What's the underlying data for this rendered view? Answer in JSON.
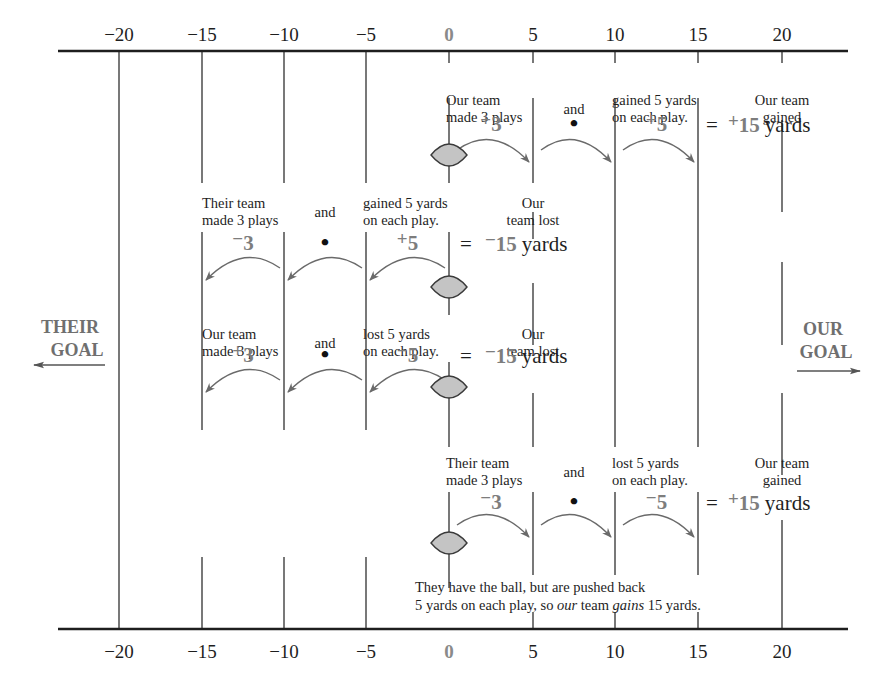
{
  "axis": {
    "ticks": [
      {
        "value": -20,
        "label": "−20",
        "x": 119
      },
      {
        "value": -15,
        "label": "−15",
        "x": 202
      },
      {
        "value": -10,
        "label": "−10",
        "x": 284
      },
      {
        "value": -5,
        "label": "−5",
        "x": 366
      },
      {
        "value": 0,
        "label": "0",
        "x": 449
      },
      {
        "value": 5,
        "label": "5",
        "x": 533
      },
      {
        "value": 10,
        "label": "10",
        "x": 615
      },
      {
        "value": 15,
        "label": "15",
        "x": 698
      },
      {
        "value": 20,
        "label": "20",
        "x": 782
      }
    ],
    "top_y": 51,
    "bottom_y": 629
  },
  "goals": {
    "left": {
      "line1": "THEIR",
      "line2": "GOAL",
      "arrow": "left-arrow"
    },
    "right": {
      "line1": "OUR",
      "line2": "GOAL",
      "arrow": "right-arrow"
    }
  },
  "rows": [
    {
      "id": "row1",
      "factor1_caption": [
        "Our team",
        "made 3 plays"
      ],
      "and_label": "and",
      "factor2_caption": [
        "gained 5 yards",
        "on each play."
      ],
      "factor1": {
        "sign": "+",
        "value": "3"
      },
      "operator": "•",
      "factor2": {
        "sign": "+",
        "value": "5"
      },
      "equals": "=",
      "result_caption": [
        "Our team",
        "gained"
      ],
      "result": {
        "sign": "+",
        "value": "15",
        "unit": "yards"
      },
      "direction": "right",
      "ball_x": 449,
      "arrows": [
        [
          449,
          533
        ],
        [
          533,
          615
        ],
        [
          615,
          698
        ]
      ]
    },
    {
      "id": "row2",
      "factor1_caption": [
        "Their team",
        "made 3 plays"
      ],
      "and_label": "and",
      "factor2_caption": [
        "gained 5 yards",
        "on each play."
      ],
      "factor1": {
        "sign": "−",
        "value": "3"
      },
      "operator": "•",
      "factor2": {
        "sign": "+",
        "value": "5"
      },
      "equals": "=",
      "result_caption": [
        "Our",
        "team lost"
      ],
      "result": {
        "sign": "−",
        "value": "15",
        "unit": "yards"
      },
      "direction": "left",
      "ball_x": 449,
      "arrows": [
        [
          449,
          366
        ],
        [
          366,
          284
        ],
        [
          284,
          202
        ]
      ]
    },
    {
      "id": "row3",
      "factor1_caption": [
        "Our team",
        "made 3 plays"
      ],
      "and_label": "and",
      "factor2_caption": [
        "lost 5 yards",
        "on each play."
      ],
      "factor1": {
        "sign": "+",
        "value": "3"
      },
      "operator": "•",
      "factor2": {
        "sign": "−",
        "value": "5"
      },
      "equals": "=",
      "result_caption": [
        "Our",
        "team lost"
      ],
      "result": {
        "sign": "−",
        "value": "15",
        "unit": "yards"
      },
      "direction": "left",
      "ball_x": 449,
      "arrows": [
        [
          449,
          366
        ],
        [
          366,
          284
        ],
        [
          284,
          202
        ]
      ]
    },
    {
      "id": "row4",
      "factor1_caption": [
        "Their team",
        "made 3 plays"
      ],
      "and_label": "and",
      "factor2_caption": [
        "lost 5 yards",
        "on each play."
      ],
      "factor1": {
        "sign": "−",
        "value": "3"
      },
      "operator": "•",
      "factor2": {
        "sign": "−",
        "value": "5"
      },
      "equals": "=",
      "result_caption": [
        "Our team",
        "gained"
      ],
      "result": {
        "sign": "+",
        "value": "15",
        "unit": "yards"
      },
      "direction": "right",
      "ball_x": 449,
      "arrows": [
        [
          449,
          533
        ],
        [
          533,
          615
        ],
        [
          615,
          698
        ]
      ]
    }
  ],
  "footnote": {
    "line1": "They have the ball, but are pushed back",
    "line2_parts": [
      {
        "text": "5 yards on each play, so ",
        "italic": false
      },
      {
        "text": "our",
        "italic": true
      },
      {
        "text": " team ",
        "italic": false
      },
      {
        "text": "gains",
        "italic": true
      },
      {
        "text": " 15 yards.",
        "italic": false
      }
    ]
  },
  "colors": {
    "line": "#1e1e1e",
    "arrow": "#6a6a6a",
    "ball_fill": "#c4c4c4",
    "ball_stroke": "#3a3a3a",
    "emphasis_text": "#7d7d7d"
  }
}
